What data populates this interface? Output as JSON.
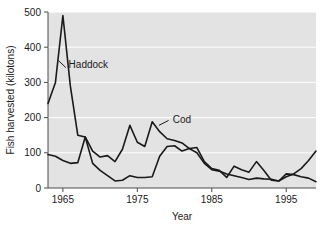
{
  "chart_data": {
    "type": "line",
    "title": "",
    "xlabel": "Year",
    "ylabel": "Fish harvested (kilotons)",
    "xlim": [
      1963,
      1999
    ],
    "ylim": [
      0,
      500
    ],
    "xticks": [
      1965,
      1975,
      1985,
      1995
    ],
    "xtick_labels": [
      "1965",
      "1975",
      "1985",
      "1995"
    ],
    "yticks": [
      0,
      100,
      200,
      300,
      400,
      500
    ],
    "ytick_labels": [
      "0",
      "100",
      "200",
      "300",
      "400",
      "500"
    ],
    "grid": "horizontal-white-gridlines",
    "legend_position": "inline-annotations",
    "plot_bg_color": "#e3e3e3",
    "line_color": "#1a1a1a",
    "x": [
      1963,
      1964,
      1965,
      1966,
      1967,
      1968,
      1969,
      1970,
      1971,
      1972,
      1973,
      1974,
      1975,
      1976,
      1977,
      1978,
      1979,
      1980,
      1981,
      1982,
      1983,
      1984,
      1985,
      1986,
      1987,
      1988,
      1989,
      1990,
      1991,
      1992,
      1993,
      1994,
      1995,
      1996,
      1997,
      1998,
      1999
    ],
    "series": [
      {
        "name": "Haddock",
        "label": "Haddock",
        "values": [
          240,
          300,
          490,
          290,
          150,
          145,
          70,
          50,
          35,
          20,
          22,
          35,
          30,
          30,
          32,
          90,
          118,
          120,
          105,
          112,
          100,
          70,
          52,
          48,
          40,
          35,
          30,
          24,
          28,
          26,
          25,
          20,
          32,
          40,
          55,
          78,
          105
        ]
      },
      {
        "name": "Cod",
        "label": "Cod",
        "values": [
          95,
          90,
          78,
          70,
          72,
          145,
          105,
          88,
          92,
          75,
          110,
          178,
          130,
          118,
          188,
          160,
          140,
          135,
          128,
          112,
          115,
          75,
          55,
          50,
          30,
          62,
          52,
          45,
          75,
          50,
          22,
          20,
          40,
          38,
          32,
          28,
          18
        ]
      }
    ],
    "annotations": [
      {
        "text": "Haddock",
        "x": 1965.5,
        "y": 350
      },
      {
        "text": "Cod",
        "x": 1979.5,
        "y": 195
      }
    ]
  },
  "figure": {
    "alt_name": "cod-haddock-harvest-line-chart"
  }
}
